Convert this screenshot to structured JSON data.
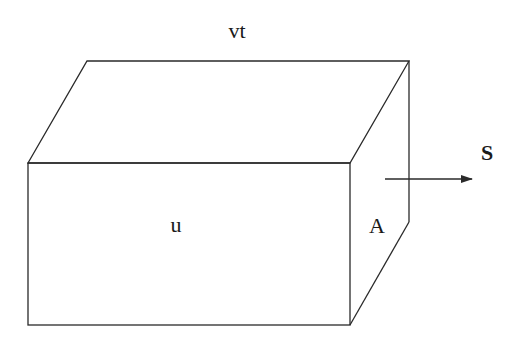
{
  "diagram": {
    "type": "box-perspective",
    "stroke_color": "#2a2a2a",
    "background": "#ffffff",
    "labels": {
      "top": "vt",
      "front": "u",
      "side": "A",
      "arrow": "S"
    },
    "arrow": {
      "direction": "right"
    }
  }
}
